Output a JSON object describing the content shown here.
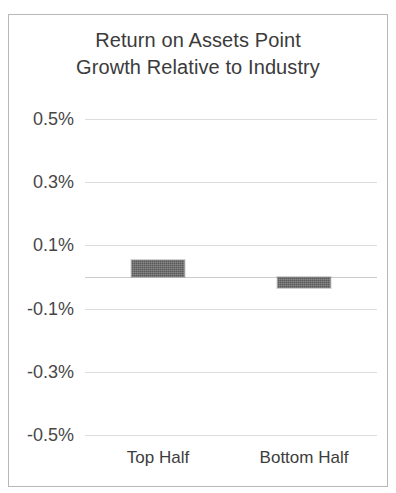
{
  "chart_data": {
    "type": "bar",
    "title": "Return on Assets Point Growth Relative to Industry",
    "title_lines": [
      "Return on Assets Point",
      "Growth Relative to Industry"
    ],
    "categories": [
      "Top Half",
      "Bottom Half"
    ],
    "values": [
      0.054,
      -0.035
    ],
    "value_labels": [
      "0.054%",
      "-0.035%"
    ],
    "xlabel": "",
    "ylabel": "",
    "ylim": [
      -0.5,
      0.5
    ],
    "ytick_values": [
      0.5,
      0.3,
      0.1,
      -0.1,
      -0.3,
      -0.5
    ],
    "ytick_labels": [
      "0.5%",
      "0.3%",
      "0.1%",
      "-0.1%",
      "-0.3%",
      "-0.5%"
    ],
    "grid": true,
    "zero_line": true,
    "legend": null,
    "legend_position": "none",
    "series": [
      {
        "name": "Return on Assets Point Growth Relative to Industry",
        "values": [
          0.054,
          -0.035
        ]
      }
    ],
    "colors": {
      "bar_fill": "#5a5a5a",
      "gridline": "#dcdcdc",
      "zero_line": "#c9c9c9",
      "border": "#b8b8b8",
      "text": "#3d3d3d",
      "title_text": "#3b3b3b",
      "background": "#ffffff"
    }
  }
}
